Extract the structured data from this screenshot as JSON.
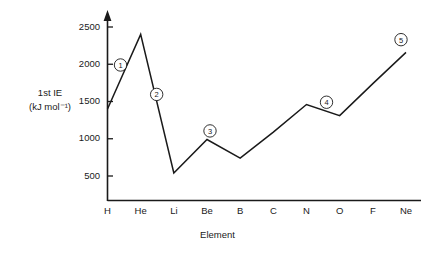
{
  "chart_data": {
    "type": "line",
    "title": "",
    "subtitle": "",
    "xlabel": "Element",
    "ylabel_line1": "1st IE",
    "ylabel_line2": "(kJ mol⁻¹)",
    "categories": [
      "H",
      "He",
      "Li",
      "Be",
      "B",
      "C",
      "N",
      "O",
      "F",
      "Ne"
    ],
    "values": [
      1400,
      2400,
      540,
      990,
      740,
      1090,
      1460,
      1310,
      1740,
      2160
    ],
    "series": [
      {
        "name": "1st ionisation energy",
        "values": [
          1400,
          2400,
          540,
          990,
          740,
          1090,
          1460,
          1310,
          1740,
          2160
        ]
      }
    ],
    "ylim": [
      0,
      2600
    ],
    "yticks": [
      500,
      1000,
      1500,
      2000,
      2500
    ],
    "ytick_labels": [
      "500",
      "1000",
      "1500",
      "2000",
      "2500"
    ],
    "grid": false,
    "legend": "none",
    "y_axis_arrow": true,
    "line_color": "#1a1a1a",
    "axis_color": "#1a1a1a",
    "background_color": "#ffffff",
    "annotations": [
      {
        "id": "1",
        "label": "①",
        "number": "1",
        "near": "H-He rise"
      },
      {
        "id": "2",
        "label": "②",
        "number": "2",
        "near": "He-Li fall"
      },
      {
        "id": "3",
        "label": "③",
        "number": "3",
        "near": "Be peak"
      },
      {
        "id": "4",
        "label": "④",
        "number": "4",
        "near": "N-O fall"
      },
      {
        "id": "5",
        "label": "⑤",
        "number": "5",
        "near": "Ne end point"
      }
    ]
  }
}
